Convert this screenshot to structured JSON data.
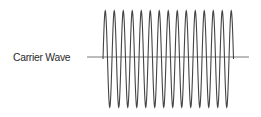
{
  "diagram": {
    "label": "Carrier Wave",
    "colors": {
      "wave": "#444444",
      "baseline": "#7a7a7a",
      "text": "#2b2b2b",
      "background": "#ffffff"
    },
    "baseline": {
      "x1": 87,
      "x2": 249,
      "y": 57
    },
    "wave": {
      "x_start": 103,
      "cycles": 14.5,
      "period_px": 9,
      "center_y": 59,
      "peak_y": 11,
      "trough_y": 107
    }
  }
}
